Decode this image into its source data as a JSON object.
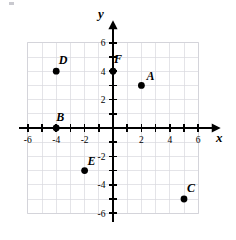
{
  "figure": {
    "type": "coordinate-plane",
    "title": "",
    "background_color": "#ffffff",
    "grid_color": "#d9d9de",
    "axis_color": "#000000",
    "point_color": "#000000"
  },
  "axes": {
    "x": {
      "name": "x",
      "min": -6.6,
      "max": 6.6,
      "tick_step": 1,
      "labels": [
        "-6",
        "-4",
        "-2",
        "2",
        "4",
        "6"
      ],
      "label_values": [
        -6,
        -4,
        -2,
        2,
        4,
        6
      ],
      "arrow": "right"
    },
    "y": {
      "name": "y",
      "min": -6.6,
      "max": 6.6,
      "tick_step": 1,
      "labels": [
        "6",
        "4",
        "2",
        "-2",
        "-4",
        "-6"
      ],
      "label_values": [
        6,
        4,
        2,
        -2,
        -4,
        -6
      ],
      "arrow": "up"
    }
  },
  "grid": {
    "visible": true,
    "x_range": [
      -6,
      6
    ],
    "y_range": [
      -6,
      6
    ],
    "step": 1
  },
  "chart_data": {
    "type": "scatter",
    "title": "",
    "xlabel": "x",
    "ylabel": "y",
    "xlim": [
      -6,
      6
    ],
    "ylim": [
      -6,
      6
    ],
    "grid": true,
    "legend": "none",
    "points": [
      {
        "label": "A",
        "x": 2,
        "y": 3,
        "label_dx": 9,
        "label_dy": -5
      },
      {
        "label": "B",
        "x": -4,
        "y": 0,
        "label_dx": 4,
        "label_dy": -7
      },
      {
        "label": "C",
        "x": 5,
        "y": -5,
        "label_dx": 7,
        "label_dy": -7
      },
      {
        "label": "D",
        "x": -4,
        "y": 4,
        "label_dx": 7,
        "label_dy": -7
      },
      {
        "label": "E",
        "x": -2,
        "y": -3,
        "label_dx": 7,
        "label_dy": -6
      },
      {
        "label": "F",
        "x": 0,
        "y": 4,
        "label_dx": 5,
        "label_dy": -8
      }
    ]
  }
}
